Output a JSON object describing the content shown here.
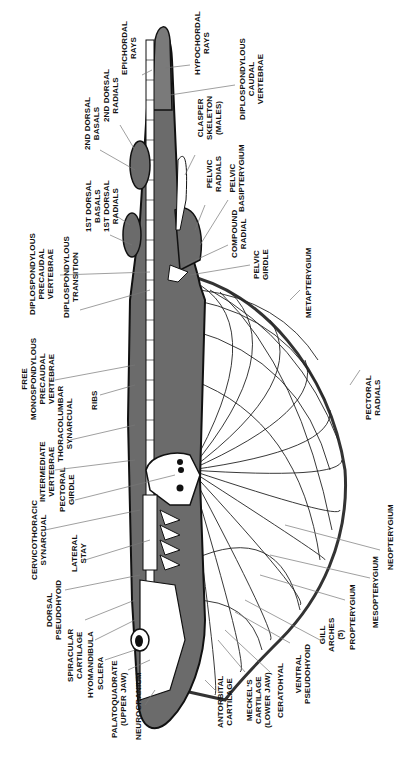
{
  "diagram": {
    "colors": {
      "body_fill": "#6b6b6b",
      "cartilage": "#ffffff",
      "outline": "#111111",
      "leader": "#777777"
    },
    "labels": {
      "epichordal_rays": "EPICHORDAL\nRAYS",
      "hypochordal_rays": "HYPOCHORDAL\nRAYS",
      "second_dorsal_radials": "2ND DORSAL\nRADIALS",
      "second_dorsal_basals": "2ND DORSAL\nBASALS",
      "diplospondylous_caudal_vertebrae": "DIPLOSPONDYLOUS\nCAUDAL\nVERTEBRAE",
      "clasper_skeleton": "CLASPER\nSKELETON\n(MALES)",
      "first_dorsal_radials": "1ST DORSAL\nRADIALS",
      "first_dorsal_basals": "1ST DORSAL\nBASALS",
      "pelvic_radials": "PELVIC\nRADIALS",
      "pelvic_basipterygium": "PELVIC\nBASIPTERYGIUM",
      "compound_radial": "COMPOUND\nRADIAL",
      "pelvic_girdle": "PELVIC\nGIRDLE",
      "diplospondylous_precaudal_vertebrae": "DIPLOSPONDYLOUS\nPRECAUDAL\nVERTEBRAE",
      "diplospondylous_transition": "DIPLOSPONDYLOUS\nTRANSITION",
      "metapterygium": "METAPTERYGIUM",
      "free_monospondylous_precaudal_vertebrae": "FREE\nMONOSPONDYLOUS\nPRECAUDAL\nVERTEBRAE",
      "ribs": "RIBS",
      "thoracolumbar_synarcual": "THORACOLUMBAR\nSYNARCUAL",
      "intermediate_vertebrae": "INTERMEDIATE\nVERTEBRAE",
      "pectoral_radials": "PECTORAL\nRADIALS",
      "pectoral_girdle": "PECTORAL\nGIRDLE",
      "cervicothoracic_synarcual": "CERVICOTHORACIC\nSYNARCUAL",
      "lateral_stay": "LATERAL\nSTAY",
      "dorsal_pseudohyoid": "DORSAL\nPSEUDOHYOID",
      "spiracular_cartilage": "SPIRACULAR\nCARTILAGE",
      "hyomandibula": "HYOMANDIBULA",
      "sclera": "SCLERA",
      "palatoquadrate": "PALATOQUADRATE\n(UPPER JAW)",
      "neurocranium": "NEUROCRANIUM",
      "antorbital_cartilage": "ANTORBITAL\nCARTILAGE",
      "meckels_cartilage": "MECKEL'S\nCARTILAGE\n(LOWER JAW)",
      "ceratohyal": "CERATOHYAL",
      "ventral_pseudohyoid": "VENTRAL\nPSEUDOHYOID",
      "gill_arches": "GILL\nARCHES\n(5)",
      "propterygium": "PROPTERYGIUM",
      "mesopterygium": "MESOPTERYGIUM",
      "neopterygium": "NEOPTERYGIUM"
    }
  }
}
